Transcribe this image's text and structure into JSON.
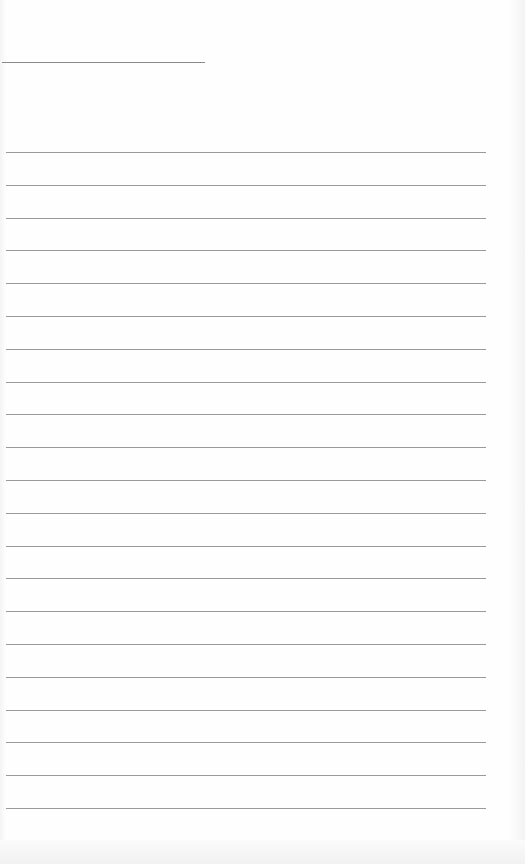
{
  "document": {
    "type": "lined-paper",
    "header_rule": {
      "x": 2,
      "y": 62,
      "width": 203
    },
    "ruled_lines": {
      "count": 21,
      "first_y": 152,
      "spacing": 32.8,
      "x_start": 6,
      "x_end": 486,
      "color": "#9a9a9a"
    },
    "paper_color": "#fdfdfd",
    "text": []
  }
}
